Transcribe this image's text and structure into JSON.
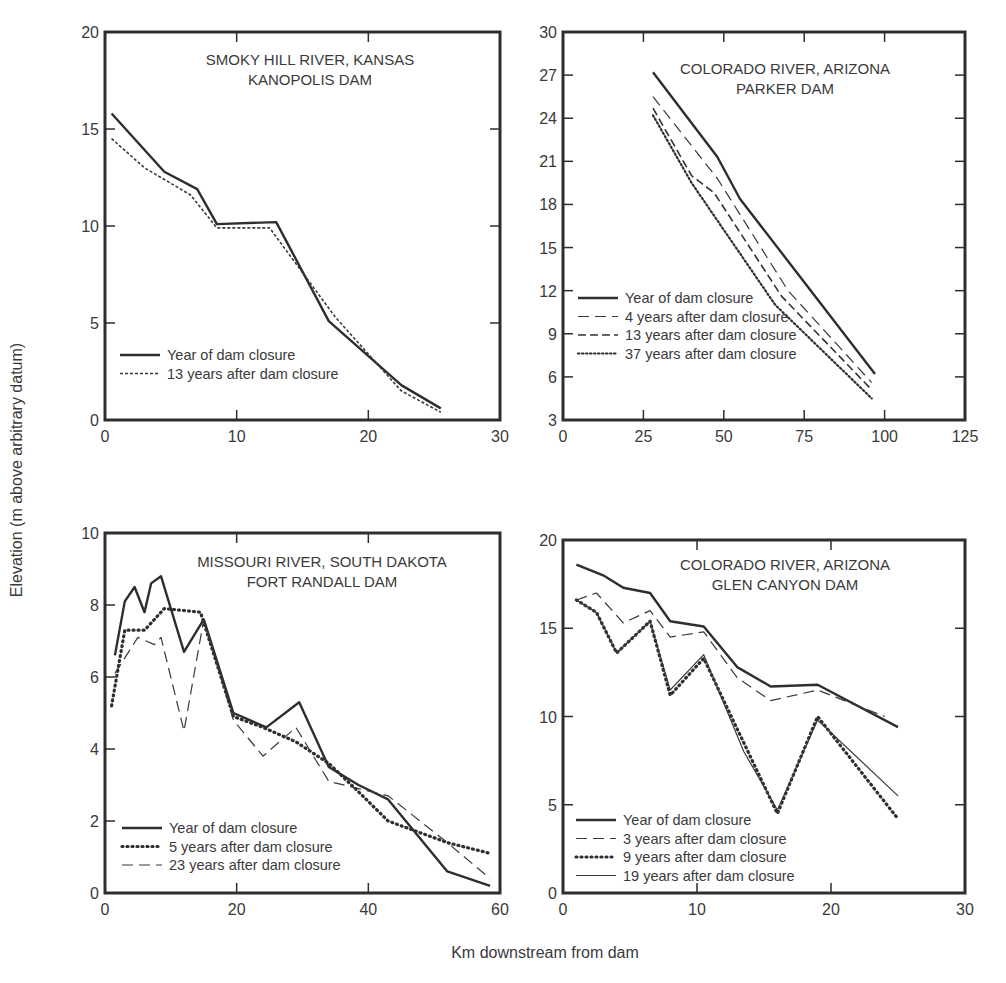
{
  "figure": {
    "ylabel": "Elevation (m above arbitrary datum)",
    "xlabel": "Km downstream from dam"
  },
  "chart_data": [
    {
      "type": "line",
      "title": "SMOKY HILL RIVER, KANSAS",
      "subtitle": "KANOPOLIS DAM",
      "xlabel": "Km downstream from dam",
      "ylabel": "Elevation (m above arbitrary datum)",
      "xlim": [
        0,
        30
      ],
      "ylim": [
        0,
        20
      ],
      "xticks": [
        0,
        10,
        20,
        30
      ],
      "yticks": [
        0,
        5,
        10,
        15,
        20
      ],
      "grid": false,
      "legend_position": "lower-left",
      "series": [
        {
          "name": "Year of dam closure",
          "style": "solid-thick",
          "x": [
            0.5,
            4.5,
            7,
            8.5,
            13,
            17,
            22.5,
            25.5
          ],
          "y": [
            15.8,
            12.8,
            11.9,
            10.1,
            10.2,
            5.1,
            1.8,
            0.6
          ]
        },
        {
          "name": "13 years after dam closure",
          "style": "dotted-fine",
          "x": [
            0.5,
            3,
            6.5,
            8.5,
            12.5,
            17.5,
            22.5,
            25.5
          ],
          "y": [
            14.5,
            13.0,
            11.6,
            9.9,
            9.9,
            5.3,
            1.5,
            0.4
          ]
        }
      ]
    },
    {
      "type": "line",
      "title": "COLORADO RIVER, ARIZONA",
      "subtitle": "PARKER DAM",
      "xlabel": "Km downstream from dam",
      "ylabel": "Elevation (m above arbitrary datum)",
      "xlim": [
        0,
        125
      ],
      "ylim": [
        3,
        30
      ],
      "xticks": [
        0,
        25,
        50,
        75,
        100,
        125
      ],
      "yticks": [
        3,
        6,
        9,
        12,
        15,
        18,
        21,
        24,
        27,
        30
      ],
      "grid": false,
      "legend_position": "lower-left",
      "series": [
        {
          "name": "Year of dam closure",
          "style": "solid-thick",
          "x": [
            28,
            48,
            55,
            97
          ],
          "y": [
            27.2,
            21.3,
            18.4,
            6.2
          ]
        },
        {
          "name": "4 years after dam closure",
          "style": "long-dash",
          "x": [
            28,
            48,
            70,
            96
          ],
          "y": [
            25.5,
            19.8,
            12.0,
            5.6
          ]
        },
        {
          "name": "13 years after dam closure",
          "style": "medium-dash",
          "x": [
            28,
            40,
            47,
            68,
            96
          ],
          "y": [
            24.7,
            20.0,
            18.8,
            11.6,
            5.1
          ]
        },
        {
          "name": "37 years after dam closure",
          "style": "dotted",
          "x": [
            28,
            40,
            66,
            96
          ],
          "y": [
            24.2,
            19.5,
            11.0,
            4.5
          ]
        }
      ]
    },
    {
      "type": "line",
      "title": "MISSOURI RIVER, SOUTH DAKOTA",
      "subtitle": "FORT RANDALL DAM",
      "xlabel": "Km downstream from dam",
      "ylabel": "Elevation (m above arbitrary datum)",
      "xlim": [
        0,
        60
      ],
      "ylim": [
        0,
        10
      ],
      "xticks": [
        0,
        20,
        40,
        60
      ],
      "yticks": [
        0,
        2,
        4,
        6,
        8,
        10
      ],
      "grid": false,
      "legend_position": "lower-left",
      "series": [
        {
          "name": "Year of dam closure",
          "style": "solid-thick",
          "x": [
            1.5,
            3,
            4.5,
            6,
            7,
            8.5,
            12,
            15,
            19.5,
            24.5,
            29.5,
            34,
            38.5,
            43,
            52,
            58.5
          ],
          "y": [
            6.6,
            8.1,
            8.5,
            7.8,
            8.6,
            8.8,
            6.7,
            7.6,
            5.0,
            4.6,
            5.3,
            3.5,
            3.0,
            2.6,
            0.6,
            0.2
          ]
        },
        {
          "name": "5 years after dam closure",
          "style": "dotted-thick",
          "x": [
            1,
            3,
            6,
            9,
            14.5,
            19.5,
            24,
            29,
            34,
            38,
            43,
            52,
            58.5
          ],
          "y": [
            5.2,
            7.3,
            7.3,
            7.9,
            7.8,
            4.9,
            4.6,
            4.2,
            3.6,
            2.9,
            2.0,
            1.4,
            1.1
          ]
        },
        {
          "name": "23 years after dam closure",
          "style": "long-dash",
          "x": [
            1.5,
            5,
            7.5,
            8.5,
            12,
            15,
            19.5,
            24,
            29,
            34,
            38.5,
            43,
            52,
            58.5
          ],
          "y": [
            6.1,
            7.1,
            6.9,
            7.1,
            4.5,
            7.6,
            4.8,
            3.8,
            4.6,
            3.1,
            2.9,
            2.7,
            1.4,
            0.4
          ]
        }
      ]
    },
    {
      "type": "line",
      "title": "COLORADO RIVER, ARIZONA",
      "subtitle": "GLEN CANYON DAM",
      "xlabel": "Km downstream from dam",
      "ylabel": "Elevation (m above arbitrary datum)",
      "xlim": [
        0,
        30
      ],
      "ylim": [
        0,
        20
      ],
      "xticks": [
        0,
        10,
        20,
        30
      ],
      "yticks": [
        0,
        5,
        10,
        15,
        20
      ],
      "grid": false,
      "legend_position": "lower-left",
      "series": [
        {
          "name": "Year of dam closure",
          "style": "solid-thick",
          "x": [
            1,
            3,
            4.5,
            6.5,
            8,
            10.5,
            13,
            15.5,
            19,
            25
          ],
          "y": [
            18.6,
            18.0,
            17.3,
            17.0,
            15.4,
            15.1,
            12.8,
            11.7,
            11.8,
            9.4
          ]
        },
        {
          "name": "3 years after dam closure",
          "style": "long-dash",
          "x": [
            1,
            2.5,
            4.5,
            6.5,
            8,
            10.5,
            13,
            15.5,
            19,
            24
          ],
          "y": [
            16.6,
            17.0,
            15.3,
            16.0,
            14.5,
            14.8,
            12.2,
            10.9,
            11.5,
            10.0
          ]
        },
        {
          "name": "9 years after dam closure",
          "style": "dotted-thick",
          "x": [
            1,
            2.5,
            4,
            6.5,
            8,
            10.5,
            16,
            19,
            25
          ],
          "y": [
            16.6,
            15.9,
            13.6,
            15.4,
            11.2,
            13.3,
            4.5,
            10.0,
            4.2
          ]
        },
        {
          "name": "19 years after dam closure",
          "style": "solid-thin",
          "x": [
            1,
            2.5,
            4,
            6.5,
            8,
            10.5,
            13.5,
            16,
            19,
            25
          ],
          "y": [
            16.6,
            15.9,
            13.6,
            15.4,
            11.5,
            13.5,
            8.0,
            4.7,
            9.8,
            5.5
          ]
        }
      ]
    }
  ]
}
